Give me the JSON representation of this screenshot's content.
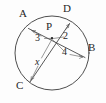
{
  "figure": {
    "type": "circle-with-intersecting-chords",
    "background_color": "#fdfdfd",
    "stroke_color": "#3a3a3a",
    "label_color": "#272727",
    "width": 106,
    "height": 103
  },
  "points": {
    "A": {
      "label": "A",
      "x": 28,
      "y": 27
    },
    "B": {
      "label": "B",
      "x": 86,
      "y": 57
    },
    "C": {
      "label": "C",
      "x": 29,
      "y": 83
    },
    "D": {
      "label": "D",
      "x": 70,
      "y": 22
    },
    "P": {
      "label": "P",
      "x": 52,
      "y": 38
    }
  },
  "circle": {
    "center_x": 52,
    "center_y": 53,
    "radius": 37
  },
  "chords": [
    {
      "name": "chord-AB",
      "from": "A",
      "to": "B"
    },
    {
      "name": "chord-CD",
      "from": "C",
      "to": "D"
    }
  ],
  "segment_labels": {
    "ap": "3",
    "pd": "2",
    "pb": "4",
    "pc": "x"
  },
  "labels": {
    "A": "A",
    "B": "B",
    "C": "C",
    "D": "D",
    "P": "P",
    "three": "3",
    "two": "2",
    "four": "4",
    "x": "x"
  }
}
